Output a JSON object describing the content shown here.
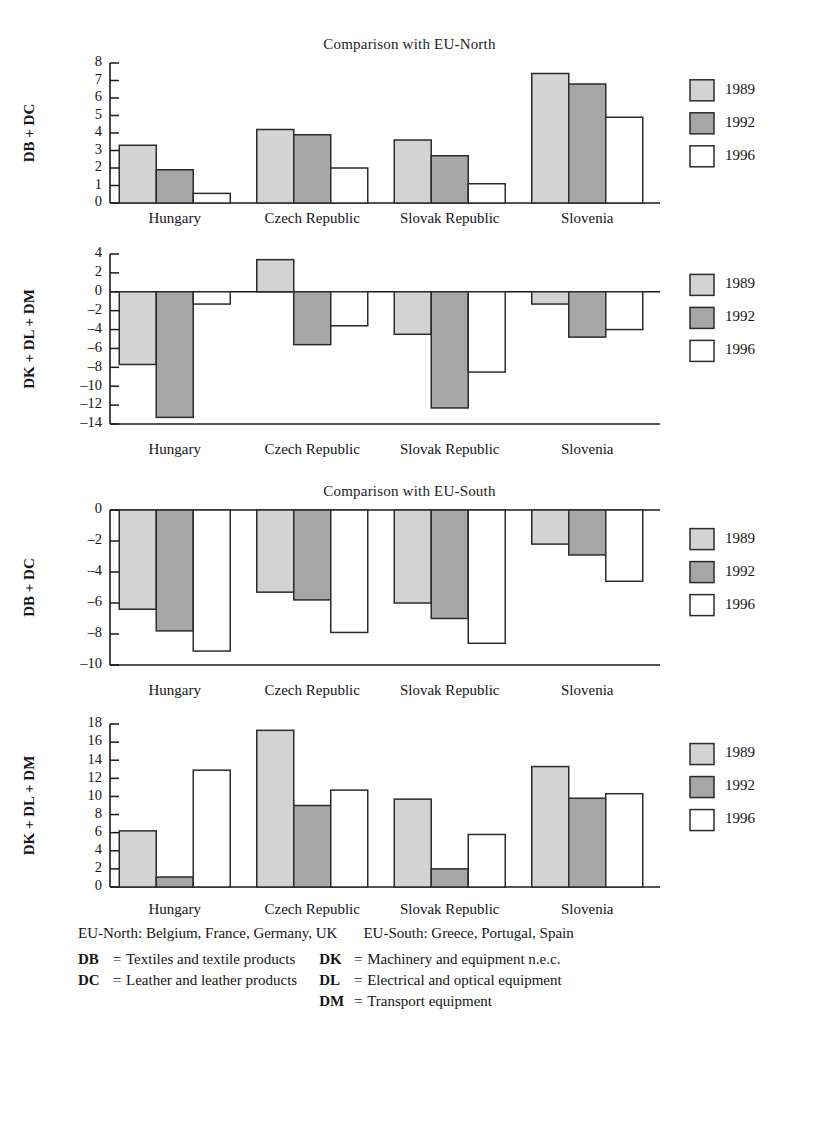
{
  "titles": {
    "north": "Comparison with EU-North",
    "south": "Comparison with EU-South"
  },
  "legend": {
    "entries": [
      {
        "label": "1989",
        "color": "#d3d3d3"
      },
      {
        "label": "1992",
        "color": "#a6a6a6"
      },
      {
        "label": "1996",
        "color": "#ffffff"
      }
    ]
  },
  "footnotes": {
    "regions": [
      "EU-North: Belgium, France, Germany, UK",
      "EU-South: Greece, Portugal, Spain"
    ],
    "left_codes": [
      {
        "code": "DB",
        "eq": "=",
        "def": "Textiles and textile products"
      },
      {
        "code": "DC",
        "eq": "=",
        "def": "Leather and leather products"
      }
    ],
    "right_codes": [
      {
        "code": "DK",
        "eq": "=",
        "def": "Machinery and equipment n.e.c."
      },
      {
        "code": "DL",
        "eq": "=",
        "def": "Electrical and optical equipment"
      },
      {
        "code": "DM",
        "eq": "=",
        "def": "Transport equipment"
      }
    ]
  },
  "chart_data": [
    {
      "id": "north-db-dc",
      "type": "bar",
      "title": "Comparison with EU-North",
      "ylabel": "DB + DC",
      "xlabel": "",
      "categories": [
        "Hungary",
        "Czech Republic",
        "Slovak Republic",
        "Slovenia"
      ],
      "series": [
        {
          "name": "1989",
          "color": "#d3d3d3",
          "values": [
            3.3,
            4.2,
            3.6,
            7.4
          ]
        },
        {
          "name": "1992",
          "color": "#a6a6a6",
          "values": [
            1.9,
            3.9,
            2.7,
            6.8
          ]
        },
        {
          "name": "1996",
          "color": "#ffffff",
          "values": [
            0.55,
            2.0,
            1.1,
            4.9
          ]
        }
      ],
      "ylim": [
        0,
        8
      ],
      "yticks": [
        0,
        1,
        2,
        3,
        4,
        5,
        6,
        7,
        8
      ],
      "ytick_labels": [
        "0",
        "1",
        "2",
        "3",
        "4",
        "5",
        "6",
        "7",
        "8"
      ],
      "grid": false,
      "legend_position": "right"
    },
    {
      "id": "north-dk-dl-dm",
      "type": "bar",
      "title": "",
      "ylabel": "DK + DL + DM",
      "xlabel": "",
      "categories": [
        "Hungary",
        "Czech Republic",
        "Slovak Republic",
        "Slovenia"
      ],
      "series": [
        {
          "name": "1989",
          "color": "#d3d3d3",
          "values": [
            -7.7,
            3.4,
            -4.5,
            -1.3
          ]
        },
        {
          "name": "1992",
          "color": "#a6a6a6",
          "values": [
            -13.3,
            -5.6,
            -12.3,
            -4.8
          ]
        },
        {
          "name": "1996",
          "color": "#ffffff",
          "values": [
            -1.3,
            -3.6,
            -8.5,
            -4.0
          ]
        }
      ],
      "ylim": [
        -14,
        4
      ],
      "yticks": [
        4,
        2,
        0,
        -2,
        -4,
        -6,
        -8,
        -10,
        -12,
        -14
      ],
      "ytick_labels": [
        "4",
        "2",
        "0",
        "–2",
        "–4",
        "–6",
        "–8",
        "–10",
        "–12",
        "–14"
      ],
      "grid": false,
      "legend_position": "right"
    },
    {
      "id": "south-db-dc",
      "type": "bar",
      "title": "Comparison with EU-South",
      "ylabel": "DB + DC",
      "xlabel": "",
      "categories": [
        "Hungary",
        "Czech Republic",
        "Slovak Republic",
        "Slovenia"
      ],
      "series": [
        {
          "name": "1989",
          "color": "#d3d3d3",
          "values": [
            -6.4,
            -5.3,
            -6.0,
            -2.2
          ]
        },
        {
          "name": "1992",
          "color": "#a6a6a6",
          "values": [
            -7.8,
            -5.8,
            -7.0,
            -2.9
          ]
        },
        {
          "name": "1996",
          "color": "#ffffff",
          "values": [
            -9.1,
            -7.9,
            -8.6,
            -4.6
          ]
        }
      ],
      "ylim": [
        -10,
        0
      ],
      "yticks": [
        0,
        -2,
        -4,
        -6,
        -8,
        -10
      ],
      "ytick_labels": [
        "0",
        "–2",
        "–4",
        "–6",
        "–8",
        "–10"
      ],
      "grid": false,
      "legend_position": "right"
    },
    {
      "id": "south-dk-dl-dm",
      "type": "bar",
      "title": "",
      "ylabel": "DK + DL + DM",
      "xlabel": "",
      "categories": [
        "Hungary",
        "Czech Republic",
        "Slovak Republic",
        "Slovenia"
      ],
      "series": [
        {
          "name": "1989",
          "color": "#d3d3d3",
          "values": [
            6.2,
            17.3,
            9.7,
            13.3
          ]
        },
        {
          "name": "1992",
          "color": "#a6a6a6",
          "values": [
            1.1,
            9.0,
            2.0,
            9.8
          ]
        },
        {
          "name": "1996",
          "color": "#ffffff",
          "values": [
            12.9,
            10.7,
            5.8,
            10.3
          ]
        }
      ],
      "ylim": [
        0,
        18
      ],
      "yticks": [
        0,
        2,
        4,
        6,
        8,
        10,
        12,
        14,
        16,
        18
      ],
      "ytick_labels": [
        "0",
        "2",
        "4",
        "6",
        "8",
        "10",
        "12",
        "14",
        "16",
        "18"
      ],
      "grid": false,
      "legend_position": "right"
    }
  ]
}
